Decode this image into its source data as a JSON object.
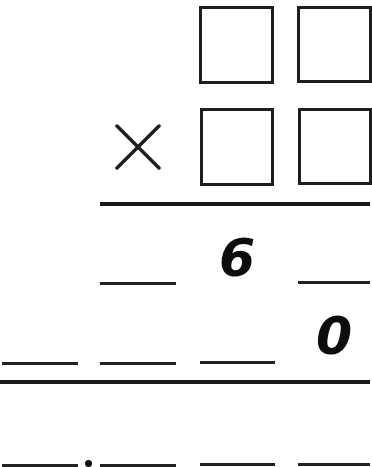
{
  "problem": {
    "operation": "multiplication",
    "operator_symbol": "×",
    "multiplicand": {
      "digit_boxes": [
        {
          "value": ""
        },
        {
          "value": ""
        }
      ]
    },
    "multiplier": {
      "digit_boxes": [
        {
          "value": ""
        },
        {
          "value": ""
        }
      ]
    },
    "partial_product_1": {
      "digits": [
        "",
        "6",
        ""
      ]
    },
    "partial_product_2": {
      "digits": [
        "",
        "",
        "",
        "0"
      ]
    },
    "final_product": {
      "digits": [
        "",
        "",
        "",
        ""
      ],
      "separator": "•"
    }
  },
  "colors": {
    "ink": "#1e1e1e",
    "background": "#ffffff"
  }
}
